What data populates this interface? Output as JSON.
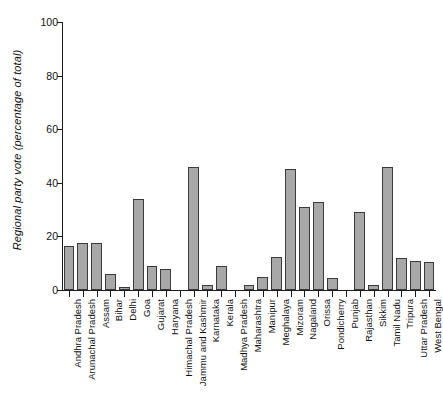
{
  "chart_data": {
    "type": "bar",
    "title": "",
    "subtitle": "",
    "xlabel": "",
    "ylabel": "Regional party vote (percentage of total)",
    "ylim": [
      0,
      100
    ],
    "yticks": [
      0,
      20,
      40,
      60,
      80,
      100
    ],
    "ytick_labels": [
      "0",
      "20",
      "40",
      "60",
      "80",
      "100"
    ],
    "grid": false,
    "legend": false,
    "legend_position": "none",
    "bar_fill_color": "#a8a8a8",
    "bar_edge_color": "#3a3a3a",
    "axis_color": "#1a1a1a",
    "background_color": "#ffffff",
    "categories": [
      "Andhra Pradesh",
      "Arunachal Pradesh",
      "Assam",
      "Bihar",
      "Delhi",
      "Goa",
      "Gujarat",
      "Haryana",
      "Himachal Pradesh",
      "Jammu and Kashmir",
      "Karnataka",
      "Kerala",
      "Madhya Pradesh",
      "Maharashtra",
      "Manipur",
      "Meghalaya",
      "Mizoram",
      "Nagaland",
      "Orissa",
      "Pondicherry",
      "Punjab",
      "Rajasthan",
      "Sikkim",
      "Tamil Nadu",
      "Tripura",
      "Uttar Pradesh",
      "West Bengal"
    ],
    "values": [
      16.5,
      17.5,
      17.5,
      6,
      1,
      34,
      9,
      8,
      0,
      46,
      2,
      9,
      0,
      2,
      5,
      12.5,
      45,
      31,
      33,
      4.5,
      0,
      29,
      2,
      46,
      12,
      11,
      10.5
    ]
  }
}
